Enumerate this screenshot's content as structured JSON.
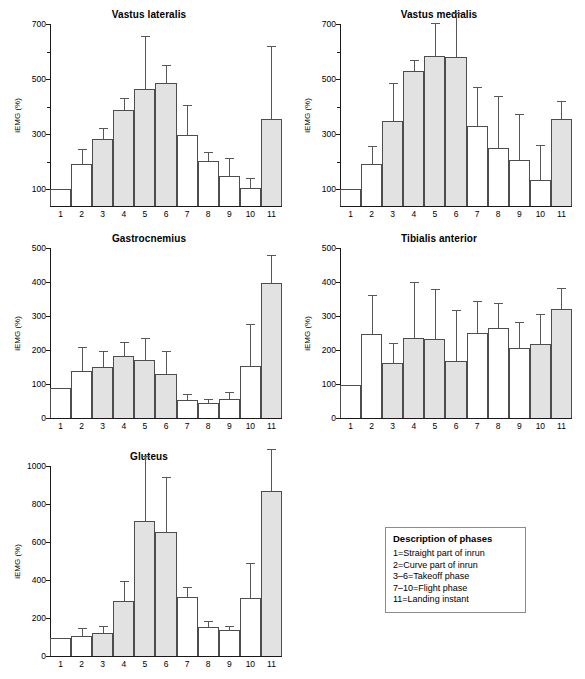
{
  "figure": {
    "bar_fill_color": "#e2e2e2",
    "bar_open_color": "#ffffff",
    "bar_border_color": "#4d4d4d",
    "error_bar_color": "#585858",
    "axis_color": "#1a1a1a"
  },
  "legend": {
    "title": "Description of phases",
    "items": [
      "1=Straight part of inrun",
      "2=Curve part of inrun",
      "3–6=Takeoff phase",
      "7–10=Flight phase",
      "11=Landing instant"
    ]
  },
  "chart_data": [
    {
      "type": "bar",
      "title": "Vastus lateralis",
      "xlabel": "",
      "ylabel": "iEMG (%)",
      "categories": [
        "1",
        "2",
        "3",
        "4",
        "5",
        "6",
        "7",
        "8",
        "9",
        "10",
        "11"
      ],
      "values": [
        100,
        193,
        283,
        389,
        465,
        485,
        297,
        203,
        148,
        104,
        355
      ],
      "errors_upper": [
        0,
        247,
        322,
        430,
        655,
        552,
        408,
        235,
        213,
        140,
        620
      ],
      "filled": [
        false,
        false,
        true,
        true,
        true,
        true,
        false,
        false,
        false,
        false,
        true
      ],
      "ylim": [
        40,
        700
      ],
      "yticks": [
        100,
        300,
        500,
        700
      ],
      "yticks_minor": [
        200,
        400,
        600
      ],
      "grid": false,
      "legend_position": "none"
    },
    {
      "type": "bar",
      "title": "Vastus medialis",
      "xlabel": "",
      "ylabel": "iEMG (%)",
      "categories": [
        "1",
        "2",
        "3",
        "4",
        "5",
        "6",
        "7",
        "8",
        "9",
        "10",
        "11"
      ],
      "values": [
        103,
        194,
        348,
        528,
        584,
        582,
        329,
        250,
        208,
        135,
        355
      ],
      "errors_upper": [
        0,
        258,
        485,
        568,
        702,
        740,
        472,
        440,
        375,
        262,
        420
      ],
      "filled": [
        false,
        false,
        true,
        true,
        true,
        true,
        false,
        false,
        false,
        false,
        true
      ],
      "ylim": [
        40,
        700
      ],
      "yticks": [
        100,
        300,
        500,
        700
      ],
      "yticks_minor": [
        200,
        400,
        600
      ],
      "grid": false,
      "legend_position": "none"
    },
    {
      "type": "bar",
      "title": "Gastrocnemius",
      "xlabel": "",
      "ylabel": "iEMG (%)",
      "categories": [
        "1",
        "2",
        "3",
        "4",
        "5",
        "6",
        "7",
        "8",
        "9",
        "10",
        "11"
      ],
      "values": [
        88,
        139,
        151,
        182,
        170,
        128,
        52,
        43,
        55,
        152,
        397
      ],
      "errors_upper": [
        0,
        209,
        197,
        223,
        235,
        196,
        72,
        57,
        77,
        277,
        478
      ],
      "filled": [
        false,
        false,
        true,
        true,
        true,
        true,
        false,
        false,
        false,
        false,
        true
      ],
      "ylim": [
        0,
        500
      ],
      "yticks": [
        0,
        100,
        200,
        300,
        400,
        500
      ],
      "yticks_minor": [],
      "grid": false,
      "legend_position": "none"
    },
    {
      "type": "bar",
      "title": "Tibialis anterior",
      "xlabel": "",
      "ylabel": "iEMG (%)",
      "categories": [
        "1",
        "2",
        "3",
        "4",
        "5",
        "6",
        "7",
        "8",
        "9",
        "10",
        "11"
      ],
      "values": [
        98,
        248,
        163,
        236,
        233,
        168,
        251,
        265,
        207,
        219,
        320
      ],
      "errors_upper": [
        0,
        363,
        222,
        399,
        378,
        318,
        345,
        338,
        282,
        305,
        382
      ],
      "filled": [
        false,
        false,
        true,
        true,
        true,
        true,
        false,
        false,
        false,
        true,
        true
      ],
      "ylim": [
        0,
        500
      ],
      "yticks": [
        0,
        100,
        200,
        300,
        400,
        500
      ],
      "yticks_minor": [],
      "grid": false,
      "legend_position": "none"
    },
    {
      "type": "bar",
      "title": "Gluteus",
      "xlabel": "",
      "ylabel": "iEMG (%)",
      "categories": [
        "1",
        "2",
        "3",
        "4",
        "5",
        "6",
        "7",
        "8",
        "9",
        "10",
        "11"
      ],
      "values": [
        95,
        105,
        123,
        292,
        710,
        652,
        311,
        155,
        137,
        305,
        868
      ],
      "errors_upper": [
        0,
        146,
        158,
        395,
        1055,
        940,
        362,
        183,
        157,
        490,
        1090
      ],
      "filled": [
        false,
        false,
        true,
        true,
        true,
        true,
        false,
        false,
        false,
        false,
        true
      ],
      "ylim": [
        0,
        1000
      ],
      "yticks": [
        0,
        200,
        400,
        600,
        800,
        1000
      ],
      "yticks_minor": [],
      "grid": false,
      "legend_position": "none"
    }
  ]
}
